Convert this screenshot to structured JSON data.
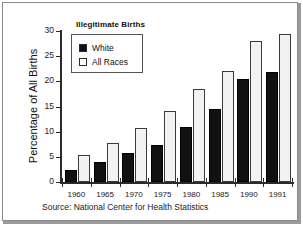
{
  "chart_data": {
    "type": "bar",
    "title": "Illegitimate Births",
    "xlabel": "",
    "ylabel": "Percentage of All Births",
    "categories": [
      "1960",
      "1965",
      "1970",
      "1975",
      "1980",
      "1985",
      "1990",
      "1991"
    ],
    "series": [
      {
        "name": "White",
        "values": [
          2.3,
          4.0,
          5.7,
          7.3,
          11.0,
          14.5,
          20.4,
          21.8
        ]
      },
      {
        "name": "All Races",
        "values": [
          5.3,
          7.7,
          10.7,
          14.2,
          18.4,
          22.0,
          28.0,
          29.5
        ]
      }
    ],
    "ylim": [
      0,
      30
    ],
    "yticks": [
      "0",
      "5",
      "10",
      "15",
      "20",
      "25",
      "30"
    ],
    "grid": false,
    "legend_position": "top-left",
    "source": "Source: National Center for Health Statistics",
    "colors": {
      "white_series": "#111111",
      "all_races_series": "#f2f2f2",
      "axis": "#2b2b2b",
      "background": "#ffffff"
    }
  }
}
